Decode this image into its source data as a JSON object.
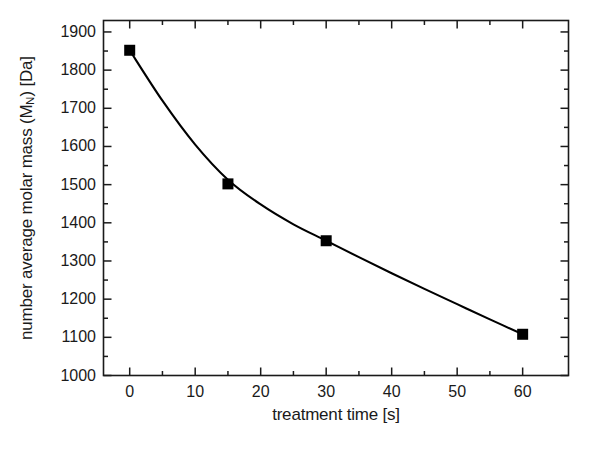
{
  "chart_data": {
    "type": "scatter",
    "title": "",
    "xlabel": "treatment time [s]",
    "ylabel_prefix": "number average molar mass (M",
    "ylabel_sub": "N",
    "ylabel_suffix": ") [Da]",
    "ylabel_plain": "number average molar mass (M_N) [Da]",
    "x": [
      0,
      15,
      30,
      60
    ],
    "values": [
      1852,
      1502,
      1353,
      1108
    ],
    "point_labels": [
      "0 s, 1852 Da",
      "15 s, 1502 Da",
      "30 s, 1353 Da",
      "60 s, 1108 Da"
    ],
    "series": [
      {
        "name": "number average molar mass",
        "x": [
          0,
          15,
          30,
          60
        ],
        "values": [
          1852,
          1502,
          1353,
          1108
        ],
        "marker": "filled-square",
        "marker_color": "#000000",
        "line_color": "#000000",
        "line_style": "solid-fit-curve"
      }
    ],
    "fit_curve": {
      "description": "smooth monotonically decreasing fit through the points",
      "x": [
        0,
        5,
        10,
        15,
        20,
        25,
        30,
        35,
        40,
        45,
        50,
        55,
        60
      ],
      "values": [
        1852,
        1720,
        1605,
        1513,
        1448,
        1396,
        1353,
        1310,
        1268,
        1227,
        1187,
        1147,
        1108
      ]
    },
    "xlim": [
      -4,
      67
    ],
    "ylim": [
      1000,
      1930
    ],
    "xticks": [
      0,
      10,
      20,
      30,
      40,
      50,
      60
    ],
    "xtick_labels": [
      "0",
      "10",
      "20",
      "30",
      "40",
      "50",
      "60"
    ],
    "xminor_ticks": [
      5,
      15,
      25,
      35,
      45,
      55
    ],
    "yticks": [
      1000,
      1100,
      1200,
      1300,
      1400,
      1500,
      1600,
      1700,
      1800,
      1900
    ],
    "ytick_labels": [
      "1000",
      "1100",
      "1200",
      "1300",
      "1400",
      "1500",
      "1600",
      "1700",
      "1800",
      "1900"
    ],
    "yminor_ticks": [
      1050,
      1150,
      1250,
      1350,
      1450,
      1550,
      1650,
      1750,
      1850
    ],
    "grid": false,
    "legend": false,
    "legend_position": "none",
    "frame": "full-box",
    "tick_direction": "in",
    "background_color": "#ffffff",
    "axis_color": "#1a1a1a"
  }
}
